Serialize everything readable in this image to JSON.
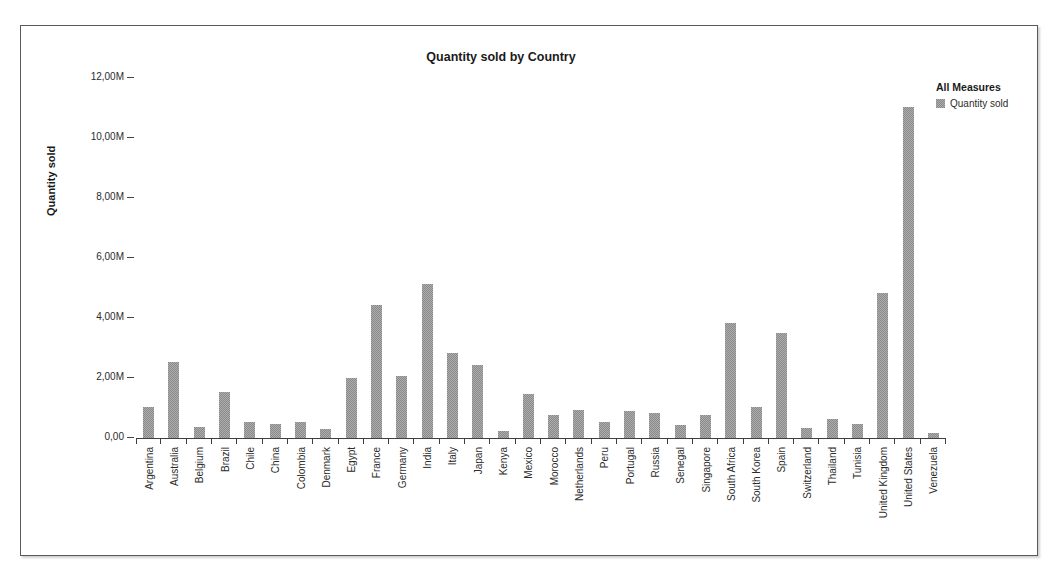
{
  "chart_data": {
    "type": "bar",
    "title": "Quantity sold by Country",
    "xlabel": "",
    "ylabel": "Quantity sold",
    "ylim": [
      0,
      12400000
    ],
    "grid": false,
    "legend_position": "right",
    "legend_title": "All Measures",
    "series_name": "Quantity sold",
    "bar_color": "#8a8a8a",
    "ytick_labels": [
      "12,00M",
      "10,00M",
      "8,00M",
      "6,00M",
      "4,00M",
      "2,00M",
      "0,00"
    ],
    "ytick_values": [
      12000000,
      10000000,
      8000000,
      6000000,
      4000000,
      2000000,
      0
    ],
    "categories": [
      "Argentina",
      "Australia",
      "Belgium",
      "Brazil",
      "Chile",
      "China",
      "Colombia",
      "Denmark",
      "Egypt",
      "France",
      "Germany",
      "India",
      "Italy",
      "Japan",
      "Kenya",
      "Mexico",
      "Morocco",
      "Netherlands",
      "Peru",
      "Portugal",
      "Russia",
      "Senegal",
      "Singapore",
      "South Africa",
      "South Korea",
      "Spain",
      "Switzerland",
      "Thailand",
      "Tunisia",
      "United Kingdom",
      "United States",
      "Venezuela"
    ],
    "values": [
      1050000,
      2550000,
      380000,
      1520000,
      520000,
      460000,
      550000,
      300000,
      2000000,
      4450000,
      2080000,
      5150000,
      2850000,
      2450000,
      220000,
      1480000,
      780000,
      950000,
      550000,
      900000,
      820000,
      450000,
      780000,
      3850000,
      1050000,
      3500000,
      350000,
      650000,
      480000,
      4850000,
      11050000,
      180000
    ]
  },
  "legend": {
    "title": "All Measures",
    "items": [
      {
        "label": "Quantity sold",
        "color": "#8a8a8a"
      }
    ]
  }
}
